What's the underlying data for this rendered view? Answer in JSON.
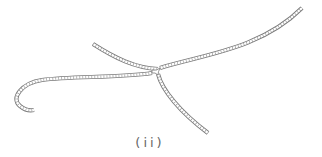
{
  "figure": {
    "label": "(ii)",
    "colors": {
      "stroke": "#7a7a7a",
      "background": "#ffffff",
      "label": "#666666"
    },
    "filaments": [
      {
        "name": "upper-left-branch",
        "path": "M 93 44 C 115 58, 135 68, 158 69"
      },
      {
        "name": "right-branch",
        "path": "M 160 68 C 200 55, 260 50, 302 8"
      },
      {
        "name": "left-hooked-filament",
        "path": "M 152 73 C 120 78, 70 76, 42 80 C 22 83, 10 98, 20 106 C 25 110, 30 111, 34 110"
      },
      {
        "name": "lower-branch",
        "path": "M 158 74 C 162 90, 180 112, 208 133"
      }
    ]
  }
}
